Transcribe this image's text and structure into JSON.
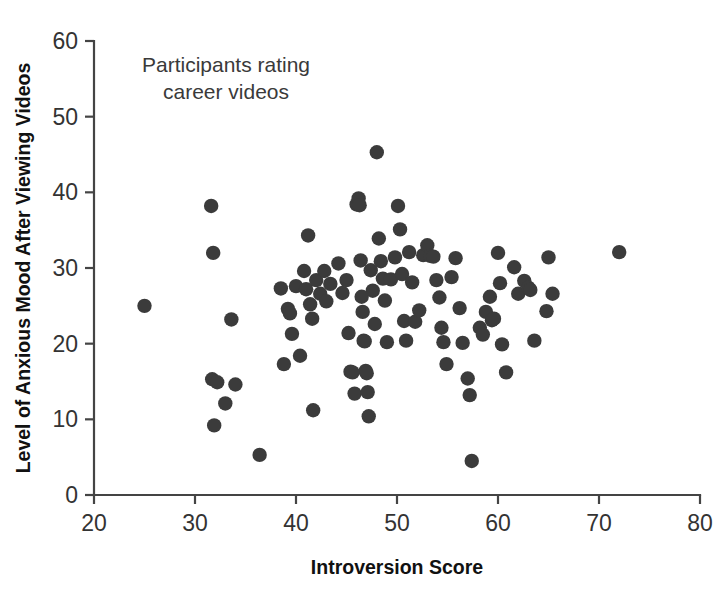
{
  "chart_data": {
    "type": "scatter",
    "title": "",
    "annotation": "Participants rating career videos",
    "annotation_lines": [
      "Participants rating",
      "career videos"
    ],
    "xlabel": "Introversion Score",
    "ylabel": "Level of Anxious Mood After Viewing Videos",
    "xlim": [
      20,
      80
    ],
    "ylim": [
      0,
      60
    ],
    "xticks": [
      20,
      30,
      40,
      50,
      60,
      70,
      80
    ],
    "yticks": [
      0,
      10,
      20,
      30,
      40,
      50,
      60
    ],
    "grid": false,
    "legend": false,
    "marker_color": "#3b3b3b",
    "marker_size": 7.2,
    "n_points": 101,
    "points": [
      [
        25.0,
        25.0
      ],
      [
        31.6,
        38.2
      ],
      [
        31.8,
        32.0
      ],
      [
        31.7,
        15.3
      ],
      [
        31.9,
        9.2
      ],
      [
        32.2,
        14.9
      ],
      [
        33.0,
        12.1
      ],
      [
        33.6,
        23.2
      ],
      [
        34.0,
        14.6
      ],
      [
        36.4,
        5.3
      ],
      [
        38.5,
        27.3
      ],
      [
        38.8,
        17.3
      ],
      [
        39.2,
        24.6
      ],
      [
        39.4,
        24.0
      ],
      [
        39.6,
        21.3
      ],
      [
        40.0,
        27.6
      ],
      [
        40.4,
        18.4
      ],
      [
        40.8,
        29.6
      ],
      [
        41.0,
        27.2
      ],
      [
        41.2,
        34.3
      ],
      [
        41.4,
        25.2
      ],
      [
        41.6,
        23.3
      ],
      [
        41.7,
        11.2
      ],
      [
        42.0,
        28.4
      ],
      [
        42.4,
        26.6
      ],
      [
        42.8,
        29.6
      ],
      [
        43.0,
        25.6
      ],
      [
        43.4,
        27.9
      ],
      [
        44.2,
        30.6
      ],
      [
        44.6,
        26.7
      ],
      [
        45.0,
        28.4
      ],
      [
        45.2,
        21.4
      ],
      [
        45.4,
        16.3
      ],
      [
        45.6,
        16.2
      ],
      [
        45.8,
        13.4
      ],
      [
        46.0,
        38.4
      ],
      [
        46.2,
        39.2
      ],
      [
        46.3,
        38.3
      ],
      [
        46.4,
        31.0
      ],
      [
        46.5,
        26.2
      ],
      [
        46.6,
        24.2
      ],
      [
        46.7,
        20.4
      ],
      [
        46.8,
        20.3
      ],
      [
        46.9,
        16.4
      ],
      [
        47.0,
        16.1
      ],
      [
        47.1,
        13.6
      ],
      [
        47.2,
        10.4
      ],
      [
        47.4,
        29.7
      ],
      [
        47.6,
        27.0
      ],
      [
        47.8,
        22.6
      ],
      [
        48.0,
        45.3
      ],
      [
        48.2,
        33.9
      ],
      [
        48.4,
        30.9
      ],
      [
        48.6,
        28.6
      ],
      [
        48.8,
        25.7
      ],
      [
        49.0,
        20.2
      ],
      [
        49.4,
        28.5
      ],
      [
        49.8,
        31.4
      ],
      [
        50.1,
        38.2
      ],
      [
        50.3,
        35.1
      ],
      [
        50.5,
        29.2
      ],
      [
        50.7,
        23.0
      ],
      [
        50.9,
        20.4
      ],
      [
        51.2,
        32.1
      ],
      [
        51.5,
        28.1
      ],
      [
        51.8,
        22.9
      ],
      [
        52.2,
        24.4
      ],
      [
        52.6,
        31.7
      ],
      [
        53.0,
        33.0
      ],
      [
        53.3,
        31.6
      ],
      [
        53.6,
        31.5
      ],
      [
        53.9,
        28.4
      ],
      [
        54.2,
        26.1
      ],
      [
        54.4,
        22.1
      ],
      [
        54.6,
        20.2
      ],
      [
        54.9,
        17.3
      ],
      [
        55.4,
        28.8
      ],
      [
        55.8,
        31.3
      ],
      [
        56.2,
        24.7
      ],
      [
        56.5,
        20.1
      ],
      [
        57.0,
        15.4
      ],
      [
        57.2,
        13.2
      ],
      [
        57.4,
        4.5
      ],
      [
        58.2,
        22.1
      ],
      [
        58.5,
        21.2
      ],
      [
        58.8,
        24.2
      ],
      [
        59.2,
        26.2
      ],
      [
        59.4,
        23.1
      ],
      [
        59.6,
        23.3
      ],
      [
        60.0,
        32.0
      ],
      [
        60.2,
        28.0
      ],
      [
        60.4,
        19.9
      ],
      [
        60.8,
        16.2
      ],
      [
        61.6,
        30.1
      ],
      [
        62.0,
        26.6
      ],
      [
        62.6,
        28.3
      ],
      [
        63.0,
        27.4
      ],
      [
        63.2,
        27.1
      ],
      [
        63.6,
        20.4
      ],
      [
        64.8,
        24.3
      ],
      [
        65.0,
        31.4
      ],
      [
        65.4,
        26.6
      ],
      [
        72.0,
        32.1
      ]
    ]
  }
}
